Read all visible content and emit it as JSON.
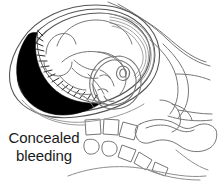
{
  "figure": {
    "background_color": "#ffffff",
    "line_color": "#6e6e6e",
    "outline_color": "#3c3c3c",
    "clot_color": "#000000",
    "caption": {
      "line1": "Concealed",
      "line2": "bleeding"
    },
    "labels": {
      "uterus": "uterus-outline",
      "fetus": "fetus",
      "fetal_head": "fetal-head",
      "placenta": "placenta-hatching",
      "clot": "concealed-blood-clot",
      "spine": "maternal-spine-vertebrae",
      "sacrum": "sacrum",
      "pelvis": "pelvic-bone",
      "abdominal_wall": "maternal-abdominal-wall"
    }
  }
}
